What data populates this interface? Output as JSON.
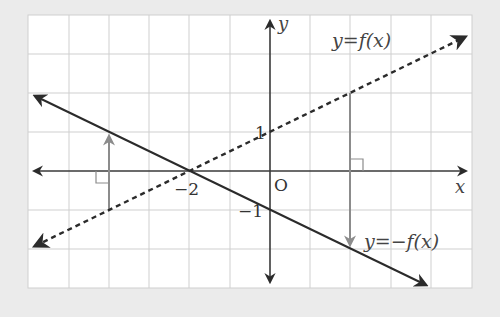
{
  "figure": {
    "background_color": "#ebebeb",
    "plot_background": "#ffffff",
    "grid_color": "#cccccc",
    "axis_color": "#333333",
    "line_color": "#2b2b2b",
    "arrow_color": "#8c8c8c"
  },
  "axes": {
    "x_label": "x",
    "y_label": "y",
    "origin_label": "O",
    "tick_labels": {
      "x_minus2": "−2",
      "y_plus1": "1",
      "y_minus1": "−1"
    },
    "x_range": [
      -6,
      5
    ],
    "y_range": [
      -3,
      4
    ],
    "grid": true
  },
  "curves": {
    "f": {
      "label": "y = f(x)",
      "label_parts": {
        "lhs": "y",
        "eq": "=",
        "rhs": "f(x)"
      },
      "style": "dashed",
      "equation": "y = x/2 + 1"
    },
    "neg_f": {
      "label": "y = −f(x)",
      "label_parts": {
        "lhs": "y",
        "eq": "=",
        "rhs": "−f(x)"
      },
      "style": "solid",
      "equation": "y = −x/2 − 1"
    }
  },
  "reflection_arrows": [
    {
      "x": -4,
      "from_y": -1,
      "to_y": 1
    },
    {
      "x": 2,
      "from_y": 2,
      "to_y": -2
    }
  ]
}
